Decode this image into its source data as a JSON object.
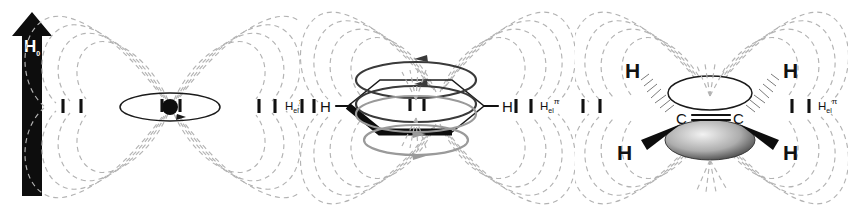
{
  "figure": {
    "type": "scientific-diagram",
    "background_color": "#ffffff",
    "fieldline_color": "#b3b3b3",
    "ink_color": "#1a1a1a"
  },
  "field_arrow": {
    "label": "H",
    "label_subscript": "0",
    "direction": "up",
    "color": "#0d0d0d"
  },
  "panels": [
    {
      "id": "panel-a",
      "name": "point-dipole",
      "caption_base": "H",
      "caption_sub": "el",
      "caption_sup": "π",
      "has_molecule": false,
      "center_marker": "filled-circle",
      "current_loop": "ellipse-with-arrow",
      "probe_ticks_left": 2,
      "probe_ticks_right": 3
    },
    {
      "id": "panel-b",
      "name": "benzene-ring-current",
      "caption_base": "H",
      "caption_sub": "el",
      "caption_sup": "π",
      "molecule": "benzene",
      "atom_labels": [
        "H",
        "H"
      ],
      "ring_current_loops": 4,
      "probe_ticks_left": 2,
      "probe_ticks_right": 2
    },
    {
      "id": "panel-c",
      "name": "ethene-pi-system",
      "caption_base": "H",
      "caption_sub": "el",
      "caption_sup": "π",
      "molecule": "ethene",
      "atom_labels": [
        "H",
        "H",
        "C",
        "C",
        "H",
        "H"
      ],
      "bond_type": "double",
      "orbital_lobes": 2,
      "probe_ticks_left": 2,
      "probe_ticks_right": 2
    }
  ]
}
